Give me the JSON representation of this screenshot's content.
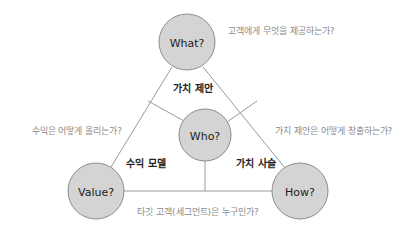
{
  "diagram": {
    "background_color": "#ffffff",
    "node_fill": "#d4d4d4",
    "node_stroke": "#8c8c8c",
    "line_color": "#9a9a9a",
    "annotation_color": "#8a8a8a",
    "edge_label_color": "#222222",
    "nodes": [
      {
        "id": "what",
        "label": "What?",
        "cx": 187,
        "cy": 42,
        "r": 28
      },
      {
        "id": "who",
        "label": "Who?",
        "cx": 205,
        "cy": 135,
        "r": 26
      },
      {
        "id": "value",
        "label": "Value?",
        "cx": 96,
        "cy": 191,
        "r": 28
      },
      {
        "id": "how",
        "label": "How?",
        "cx": 300,
        "cy": 191,
        "r": 28
      }
    ],
    "edge_labels": [
      {
        "id": "value-proposition",
        "label": "가치 제안",
        "x": 193,
        "y": 88
      },
      {
        "id": "revenue-model",
        "label": "수익 모델",
        "x": 146,
        "y": 163
      },
      {
        "id": "value-chain",
        "label": "가치 사슬",
        "x": 256,
        "y": 163
      }
    ],
    "annotations": [
      {
        "id": "what-question",
        "text": "고객에게 무엇을 제공하는가?",
        "x": 228,
        "y": 31,
        "anchor": "start"
      },
      {
        "id": "value-question",
        "text": "수익은 어떻게 올리는가?",
        "x": 122,
        "y": 131,
        "anchor": "end"
      },
      {
        "id": "how-question",
        "text": "가치 제안은 어떻게 창출하는가?",
        "x": 275,
        "y": 131,
        "anchor": "start"
      },
      {
        "id": "who-question",
        "text": "타깃 고객(세그먼트)은 누구인가?",
        "x": 198,
        "y": 212,
        "anchor": "middle"
      }
    ]
  }
}
